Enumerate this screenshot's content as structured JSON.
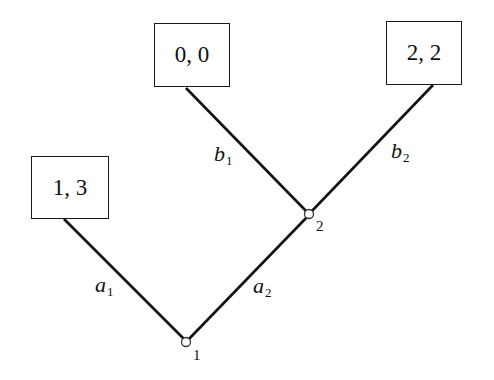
{
  "diagram": {
    "type": "extensive-form game tree",
    "nodes": [
      {
        "id": "1",
        "label": "1",
        "kind": "decision"
      },
      {
        "id": "2",
        "label": "2",
        "kind": "decision"
      }
    ],
    "payoffs": [
      {
        "id": "t_a1",
        "label": "1, 3"
      },
      {
        "id": "t_b1",
        "label": "0, 0"
      },
      {
        "id": "t_b2",
        "label": "2, 2"
      }
    ],
    "edges": [
      {
        "from": "1",
        "to": "t_a1",
        "action": "a",
        "sub": "1"
      },
      {
        "from": "1",
        "to": "2",
        "action": "a",
        "sub": "2"
      },
      {
        "from": "2",
        "to": "t_b1",
        "action": "b",
        "sub": "1"
      },
      {
        "from": "2",
        "to": "t_b2",
        "action": "b",
        "sub": "2"
      }
    ]
  }
}
